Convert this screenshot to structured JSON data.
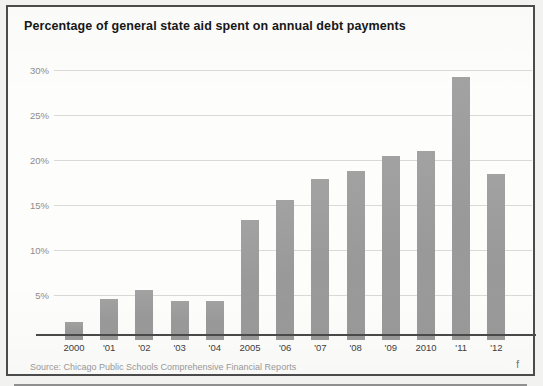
{
  "card": {
    "title": "Percentage of general state aid spent on annual debt payments",
    "source": "Source: Chicago Public Schools Comprehensive Financial Reports",
    "page_mark": "f"
  },
  "colors": {
    "bar": "#9d9d9d",
    "gridline": "#d9d9d6",
    "axis": "#4a4a4a",
    "frame": "#4b4b4b",
    "title_text": "#171717",
    "ytick_text": "#8c8c8c",
    "xtick_text": "#3d3d3d",
    "source_text": "#9b9b9b"
  },
  "chart_data": {
    "type": "bar",
    "title": "Percentage of general state aid spent on annual debt payments",
    "subtitle": "",
    "xlabel": "",
    "ylabel": "",
    "categories": [
      "2000",
      "'01",
      "'02",
      "'03",
      "'04",
      "2005",
      "'06",
      "'07",
      "'08",
      "'09",
      "2010",
      "'11",
      "'12"
    ],
    "values": [
      2.0,
      4.6,
      5.6,
      4.3,
      4.3,
      13.3,
      15.6,
      17.9,
      18.8,
      20.4,
      21.0,
      29.2,
      18.5
    ],
    "ylim": [
      0,
      31
    ],
    "yticks": [
      5,
      10,
      15,
      20,
      25,
      30
    ],
    "ytick_labels": [
      "5%",
      "10%",
      "15%",
      "20%",
      "25%",
      "30%"
    ],
    "grid": true,
    "legend": false,
    "legend_position": "none",
    "series": [
      {
        "name": "Percentage of general state aid spent on annual debt payments",
        "values": [
          2.0,
          4.6,
          5.6,
          4.3,
          4.3,
          13.3,
          15.6,
          17.9,
          18.8,
          20.4,
          21.0,
          29.2,
          18.5
        ]
      }
    ]
  }
}
